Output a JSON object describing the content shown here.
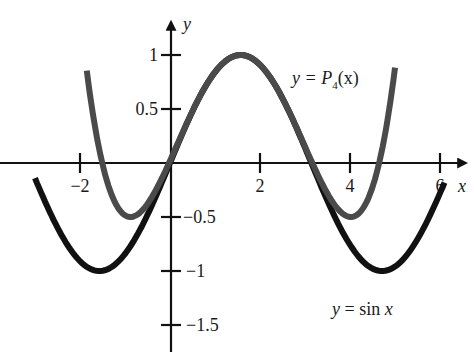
{
  "chart_data": {
    "type": "line",
    "title": "",
    "xlabel": "x",
    "ylabel": "y",
    "xlim": [
      -3.1,
      6.6
    ],
    "ylim": [
      -1.75,
      1.3
    ],
    "grid": false,
    "legend_position": "inline annotations",
    "x_ticks": [
      -2,
      2,
      4,
      6
    ],
    "x_tick_labels": [
      "−2",
      "2",
      "4",
      "6"
    ],
    "y_ticks": [
      1,
      0.5,
      -0.5,
      -1,
      -1.5
    ],
    "y_tick_labels": [
      "1",
      "0.5",
      "−0.5",
      "−1",
      "−1.5"
    ],
    "series": [
      {
        "name": "y = sin x",
        "function": "sin(x)",
        "color": "#111111",
        "x_range": [
          -3.0,
          6.1
        ],
        "sample_points": [
          [
            -3,
            -0.14
          ],
          [
            -2,
            -0.91
          ],
          [
            -1.57,
            -1
          ],
          [
            0,
            0
          ],
          [
            1.57,
            1
          ],
          [
            3.14,
            0
          ],
          [
            4.71,
            -1
          ],
          [
            6,
            -0.28
          ]
        ]
      },
      {
        "name": "y = P₄(x)",
        "function": "1 - (x - pi/2)^2/2 + (x - pi/2)^4/24",
        "color": "#4a4a4a",
        "x_range": [
          -1.85,
          5.0
        ],
        "sample_points": [
          [
            -1.85,
            0.93
          ],
          [
            -1.5,
            0.0
          ],
          [
            -0.88,
            -0.5
          ],
          [
            0,
            0.02
          ],
          [
            1.57,
            1
          ],
          [
            3.14,
            0.02
          ],
          [
            4.02,
            -0.5
          ],
          [
            4.64,
            0.0
          ],
          [
            5.0,
            0.93
          ]
        ]
      }
    ],
    "annotations": [
      {
        "text_prefix": "y = P",
        "subscript": "4",
        "text_suffix": "(x)",
        "x": 3.1,
        "y": 0.78
      },
      {
        "text": "y = sin x",
        "x": 3.6,
        "y": -1.47
      }
    ]
  },
  "labels": {
    "x_axis": "x",
    "y_axis": "y",
    "p4_prefix": "y = P",
    "p4_sub": "4",
    "p4_suffix": "(x)",
    "sin_label": "y = sin x"
  },
  "layout": {
    "origin_px": [
      170,
      163
    ],
    "px_per_x": 45,
    "px_per_y": 108
  }
}
